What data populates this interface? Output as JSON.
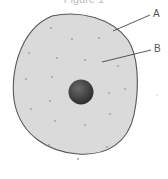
{
  "figure": {
    "title": "Figure 1",
    "labels": {
      "a": "A",
      "b": "B"
    },
    "colors": {
      "cell_fill": "#d9d9d9",
      "cell_outline": "#555555",
      "nucleus": "#4a4a4a",
      "dots": "#a9a9a9",
      "leader_lines": "#444444"
    }
  }
}
